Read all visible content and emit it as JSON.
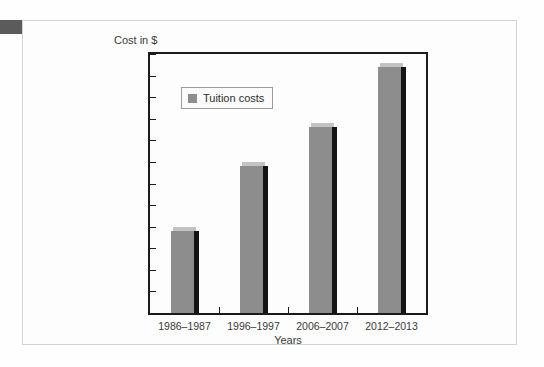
{
  "card": {
    "corner_marker_color": "#5b5b5b",
    "border_color": "#d4d4d4",
    "background": "#fdfdfd"
  },
  "legend": {
    "label": "Tuition costs",
    "swatch_color": "#8d8d8d",
    "position": "top-left-inside-plot"
  },
  "chart_data": {
    "type": "bar",
    "title": "",
    "subtitle": "",
    "categories": [
      "1986–1987",
      "1996–1997",
      "2006–2007",
      "2012–2013"
    ],
    "series": [
      {
        "name": "Tuition costs",
        "values": [
          1900,
          3400,
          4300,
          5700
        ],
        "color": "#8d8d8d"
      }
    ],
    "values": [
      1900,
      3400,
      4300,
      5700
    ],
    "xlabel": "Years",
    "ylabel": "Cost in $",
    "ylim": [
      0,
      6000
    ],
    "ytick_step": 500,
    "ytick_labels": [
      "6000",
      "5500",
      "5000",
      "4500",
      "4000",
      "3500",
      "3000",
      "2500",
      "2000",
      "1500",
      "1000",
      "500",
      "0"
    ],
    "ytick_values": [
      6000,
      5500,
      5000,
      4500,
      4000,
      3500,
      3000,
      2500,
      2000,
      1500,
      1000,
      500,
      0
    ],
    "grid": false,
    "legend": [
      "Tuition costs"
    ],
    "legend_position": "upper left",
    "bar_style": "3d-extruded",
    "axis_color": "#1b1b1b",
    "plot_background": "#fdfdfd"
  }
}
